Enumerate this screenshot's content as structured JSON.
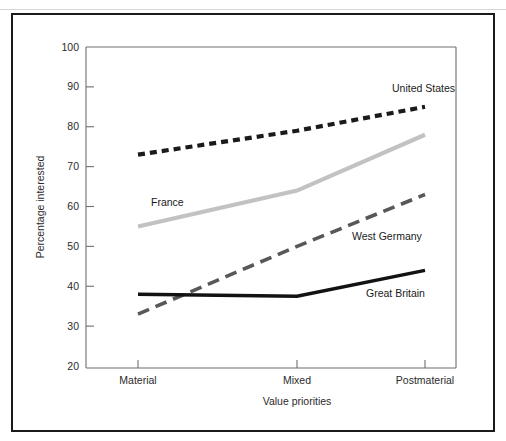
{
  "figure": {
    "caption_remnant": "",
    "frame_color": "#1a1a1a",
    "background": "#ffffff"
  },
  "chart_data": {
    "type": "line",
    "title": "",
    "xlabel": "Value priorities",
    "ylabel": "Percentage interested",
    "categories": [
      "Material",
      "Mixed",
      "Postmaterial"
    ],
    "x_tick_labels": [
      "Material",
      "Mixed",
      "Postmaterial"
    ],
    "y_tick_labels": [
      "20",
      "30",
      "40",
      "50",
      "60",
      "70",
      "80",
      "90",
      "100"
    ],
    "ylim": [
      20,
      100
    ],
    "y_tick_step": 10,
    "grid": false,
    "legend": "inline-labels",
    "series": [
      {
        "name": "United States",
        "values": [
          73,
          79,
          85
        ],
        "color": "#1a1a1a",
        "style": "dotted",
        "dasharray": "7,5",
        "width": 4.2,
        "label_x": 392,
        "label_y": 92
      },
      {
        "name": "France",
        "values": [
          55,
          64,
          78
        ],
        "color": "#c2c2c2",
        "style": "solid",
        "dasharray": "",
        "width": 4.2,
        "label_x": 151,
        "label_y": 206
      },
      {
        "name": "West Germany",
        "values": [
          33,
          50,
          63
        ],
        "color": "#585858",
        "style": "dashed",
        "dasharray": "12,7",
        "width": 3.6,
        "label_x": 352,
        "label_y": 240
      },
      {
        "name": "Great Britain",
        "values": [
          38,
          37.5,
          44
        ],
        "color": "#121212",
        "style": "solid",
        "dasharray": "",
        "width": 3.4,
        "label_x": 366,
        "label_y": 297
      }
    ]
  },
  "geometry": {
    "plot_left": 138,
    "plot_right": 456,
    "plot_top": 47,
    "plot_bottom": 366,
    "axis_box_left": 86,
    "axis_box_right": 456,
    "axis_box_top": 47,
    "axis_box_bottom": 368,
    "x_positions": [
      138,
      297,
      425
    ]
  }
}
